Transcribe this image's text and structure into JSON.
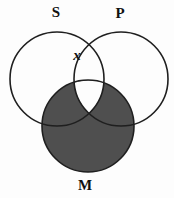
{
  "colors": {
    "background": "#fdfdfd",
    "shade": "#4f4f4f",
    "stroke": "#1f1f1f",
    "label": "#111111"
  },
  "venn": {
    "circles": [
      {
        "name": "S",
        "label": "S",
        "cx": 57,
        "cy": 79,
        "r": 47,
        "label_x": 56,
        "label_y": 17
      },
      {
        "name": "P",
        "label": "P",
        "cx": 121,
        "cy": 79,
        "r": 47,
        "label_x": 120,
        "label_y": 18
      },
      {
        "name": "M",
        "label": "M",
        "cx": 88,
        "cy": 126,
        "r": 46,
        "label_x": 85,
        "label_y": 190
      }
    ],
    "shaded_region": "M circle shaded except the S∩P∩M center region",
    "white_region_path": "M 74.1 82.8 A 46 46 0 0 1 103.9 82.8 A 47 47 0 0 1 89 113.4 A 47 47 0 0 1 74.1 82.8 Z",
    "x_mark": {
      "text": "x",
      "x": 77,
      "y": 60,
      "location": "on the P-circle boundary inside S, above M"
    }
  }
}
